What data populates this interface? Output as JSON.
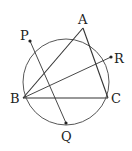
{
  "diagram": {
    "type": "geometry",
    "circle": {
      "cx": 66,
      "cy": 82,
      "r": 43
    },
    "points": {
      "A": {
        "label": "A",
        "x": 83,
        "y": 28
      },
      "B": {
        "label": "B",
        "x": 23,
        "y": 98
      },
      "C": {
        "label": "C",
        "x": 108,
        "y": 98
      },
      "P": {
        "label": "P",
        "x": 30,
        "y": 41
      },
      "Q": {
        "label": "Q",
        "x": 66,
        "y": 123
      },
      "R": {
        "label": "R",
        "x": 111,
        "y": 57
      }
    },
    "segments": [
      [
        "A",
        "B"
      ],
      [
        "B",
        "C"
      ],
      [
        "C",
        "A"
      ],
      [
        "P",
        "Q"
      ],
      [
        "B",
        "R"
      ]
    ],
    "marked_points": [
      "P",
      "Q",
      "R"
    ],
    "colors": {
      "stroke": "#333333",
      "label": "#222222"
    }
  }
}
